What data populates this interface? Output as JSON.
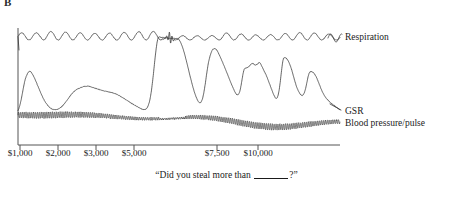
{
  "panel": {
    "label": "B"
  },
  "legend": {
    "respiration": "Respiration",
    "gsr": "GSR",
    "blood_pressure": "Blood pressure/pulse"
  },
  "caption": {
    "prefix": "“Did you steal more than ",
    "suffix": "?”"
  },
  "axis": {
    "tick_labels": [
      "$1,000",
      "$2,000",
      "$3,000",
      "$5,000",
      "$7,500",
      "$10,000"
    ],
    "tick_x": [
      20,
      58,
      96,
      134,
      217,
      258
    ],
    "x_axis_y": 145,
    "x_axis_start": 18,
    "x_axis_end": 340,
    "y_axis_x": 18,
    "y_axis_top": 28,
    "y_axis_bottom": 145
  },
  "colors": {
    "trace": "#222222",
    "axis": "#555555",
    "background": "#ffffff",
    "text": "#1a1a1a"
  },
  "chart_data": {
    "type": "line",
    "title": "",
    "xlabel": "“Did you steal more than ____?”",
    "ylabel": "",
    "grid": false,
    "legend_position": "right",
    "xlim": [
      0,
      11500
    ],
    "x_tick_values": [
      1000,
      2000,
      3000,
      5000,
      7500,
      10000
    ],
    "x_tick_labels": [
      "$1,000",
      "$2,000",
      "$3,000",
      "$5,000",
      "$7,500",
      "$10,000"
    ],
    "series": [
      {
        "name": "Respiration",
        "description": "Regular breathing oscillation, ~22 cycles across the record, with a brief flattening / irregular burst near the $4,000-$5,000 question and reduced amplitude afterward.",
        "baseline_y": 40,
        "amplitude": 8,
        "cycles": 22,
        "disruption_x": 170
      },
      {
        "name": "GSR",
        "description": "Galvanic skin response. Low wandering baseline with a small early rise near $1,000, a broad hump near $3,000, then a very large sustained deflection at the $4,000 question, followed by several tall discrete peaks between $5,000 and $10,500.",
        "peaks_x": [
          26,
          84,
          168,
          209,
          245,
          284,
          310
        ],
        "largest_peak_x": 168,
        "largest_peak_height": 100
      },
      {
        "name": "Blood pressure/pulse",
        "description": "Dense high-frequency pulse oscillation riding on a slowly undulating blood-pressure baseline; baseline rises modestly around the $4,000-$5,000 and $7,500 questions.",
        "baseline_y": 122,
        "pulse_amplitude": 6,
        "pulse_rate": 170
      }
    ]
  }
}
